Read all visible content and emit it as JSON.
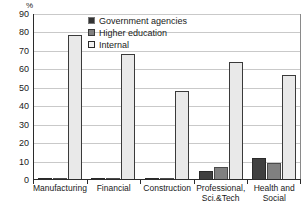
{
  "chart_data": {
    "type": "bar",
    "title": "",
    "subtitle": "",
    "xlabel": "",
    "ylabel": "%",
    "unit_label": "%",
    "ylim": [
      0,
      90
    ],
    "ytick_step": 10,
    "yticks": [
      90,
      80,
      70,
      60,
      50,
      40,
      30,
      20,
      10,
      0
    ],
    "grid": true,
    "grid_axis": "y",
    "legend_position": "top-center",
    "categories": [
      "Manufacturing",
      "Financial",
      "Construction",
      "Professional,\nSci.&Tech",
      "Health and\nSocial"
    ],
    "series": [
      {
        "name": "Government agencies",
        "color": "#404040",
        "values": [
          0.3,
          1.2,
          0.3,
          5.0,
          12.0
        ]
      },
      {
        "name": "Higher education",
        "color": "#808080",
        "values": [
          0.6,
          0.2,
          0.2,
          7.0,
          9.2
        ]
      },
      {
        "name": "Internal",
        "color": "#e9e9e9",
        "values": [
          78.5,
          68.5,
          48.5,
          64.0,
          57.0
        ]
      }
    ]
  },
  "legend": {
    "items": [
      {
        "label": "Government agencies"
      },
      {
        "label": "Higher education"
      },
      {
        "label": "Internal"
      }
    ]
  },
  "colors": {
    "government_agencies": "#404040",
    "higher_education": "#808080",
    "internal": "#e9e9e9",
    "gridline": "#c9c9c9",
    "axis": "#2b2b2b",
    "text": "#1a1a1a",
    "background": "#ffffff"
  }
}
